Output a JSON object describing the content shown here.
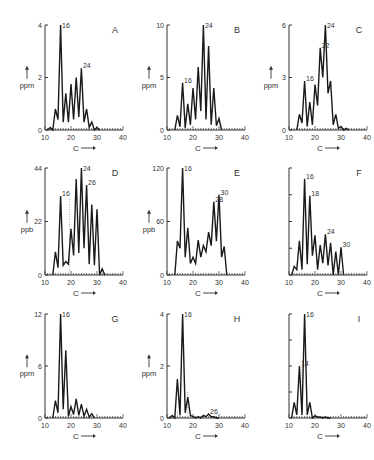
{
  "figure": {
    "x_arrow_label": "C",
    "colors": {
      "line": "#1a1a1a",
      "axis": "#333333",
      "text": "#333333",
      "dotted": "#888888"
    }
  },
  "chart_data": [
    {
      "panel": "A",
      "type": "line",
      "unit": "ppm",
      "xlim": [
        10,
        40
      ],
      "xticks": [
        10,
        20,
        30,
        40
      ],
      "ylim": [
        0,
        4
      ],
      "yticks": [
        0,
        2,
        4
      ],
      "ytick_labels": [
        "0",
        "2",
        "4"
      ],
      "xlabel": "C",
      "ylabel": "ppm",
      "x": [
        11,
        12,
        13,
        14,
        15,
        16,
        17,
        18,
        19,
        20,
        21,
        22,
        23,
        24,
        25,
        26,
        27,
        28,
        29,
        30,
        31
      ],
      "y": [
        0,
        0.1,
        0,
        0.8,
        0.4,
        4.0,
        0.3,
        1.4,
        0.3,
        1.75,
        0.4,
        2.0,
        0.5,
        2.35,
        0.3,
        0.8,
        0.1,
        0.3,
        0,
        0.1,
        0
      ],
      "peak_labels": [
        {
          "x": 16,
          "text": "16"
        },
        {
          "x": 24,
          "text": "24"
        }
      ],
      "dotted_lines": []
    },
    {
      "panel": "B",
      "type": "line",
      "unit": "ppm",
      "xlim": [
        10,
        40
      ],
      "xticks": [
        10,
        20,
        30,
        40
      ],
      "ylim": [
        0,
        10
      ],
      "yticks": [
        0,
        5,
        10
      ],
      "ytick_labels": [
        "0",
        "5",
        "10"
      ],
      "xlabel": "C",
      "ylabel": "ppm",
      "x": [
        13,
        14,
        15,
        16,
        17,
        18,
        19,
        20,
        21,
        22,
        23,
        24,
        25,
        26,
        27,
        28,
        29,
        30,
        31
      ],
      "y": [
        0,
        1.4,
        0.3,
        4.5,
        0.2,
        2.5,
        0.5,
        4.0,
        1.0,
        6.0,
        1.8,
        10.0,
        1.0,
        8.0,
        0.5,
        4.0,
        0.4,
        1.1,
        0
      ],
      "peak_labels": [
        {
          "x": 16,
          "text": "16"
        },
        {
          "x": 24,
          "text": "24"
        }
      ],
      "dotted_lines": []
    },
    {
      "panel": "C",
      "type": "line",
      "unit": "ppm",
      "xlim": [
        10,
        40
      ],
      "xticks": [
        10,
        20,
        30,
        40
      ],
      "ylim": [
        0,
        6
      ],
      "yticks": [
        0,
        3,
        6
      ],
      "ytick_labels": [
        "0",
        "3",
        "6"
      ],
      "xlabel": "C",
      "ylabel": "ppm",
      "x": [
        13,
        14,
        15,
        16,
        17,
        18,
        19,
        20,
        21,
        22,
        23,
        24,
        25,
        26,
        27,
        28,
        29,
        30,
        31,
        32,
        33
      ],
      "y": [
        0,
        0.9,
        0.4,
        2.8,
        0.2,
        1.6,
        0.3,
        2.6,
        1.4,
        4.7,
        3.0,
        6.0,
        2.1,
        2.8,
        0.3,
        0.9,
        0.1,
        0.2,
        0,
        0.1,
        0
      ],
      "peak_labels": [
        {
          "x": 16,
          "text": "16"
        },
        {
          "x": 22,
          "text": "22"
        },
        {
          "x": 24,
          "text": "24"
        }
      ],
      "dotted_lines": []
    },
    {
      "panel": "D",
      "type": "line",
      "unit": "ppb",
      "xlim": [
        10,
        40
      ],
      "xticks": [
        10,
        20,
        30,
        40
      ],
      "ylim": [
        0,
        44
      ],
      "yticks": [
        0,
        22,
        44
      ],
      "ytick_labels": [
        "0",
        "22",
        "44"
      ],
      "xlabel": "C",
      "ylabel": "ppb",
      "x": [
        13,
        14,
        15,
        16,
        17,
        18,
        19,
        20,
        21,
        22,
        23,
        24,
        25,
        26,
        27,
        28,
        29,
        30,
        31,
        32,
        33
      ],
      "y": [
        0,
        9.5,
        3.0,
        32.5,
        4.0,
        5.5,
        4.5,
        19.0,
        8.0,
        39.5,
        9.0,
        44.0,
        11.0,
        37.0,
        4.5,
        29.0,
        4.0,
        27.0,
        0,
        2.5,
        0
      ],
      "peak_labels": [
        {
          "x": 16,
          "text": "16"
        },
        {
          "x": 24,
          "text": "24"
        },
        {
          "x": 26,
          "text": "26"
        }
      ],
      "dotted_lines": [
        {
          "x": 19.5,
          "y_top": 32
        }
      ]
    },
    {
      "panel": "E",
      "type": "line",
      "unit": "ppb",
      "xlim": [
        10,
        40
      ],
      "xticks": [
        10,
        20,
        30,
        40
      ],
      "ylim": [
        0,
        120
      ],
      "yticks": [
        0,
        60,
        120
      ],
      "ytick_labels": [
        "0",
        "60",
        "120"
      ],
      "xlabel": "C",
      "ylabel": "ppb",
      "x": [
        13,
        14,
        15,
        16,
        17,
        18,
        19,
        20,
        21,
        22,
        23,
        24,
        25,
        26,
        27,
        28,
        29,
        30,
        31,
        32,
        33
      ],
      "y": [
        0,
        38,
        30,
        120,
        20,
        53,
        13,
        20,
        13,
        39,
        20,
        33,
        26,
        48,
        33,
        82,
        38,
        90,
        20,
        32,
        0
      ],
      "peak_labels": [
        {
          "x": 16,
          "text": "16"
        },
        {
          "x": 28,
          "text": "28"
        },
        {
          "x": 30,
          "text": "30"
        }
      ],
      "dotted_lines": []
    },
    {
      "panel": "F",
      "type": "line",
      "unit": "",
      "xlim": [
        10,
        40
      ],
      "xticks": [
        10,
        20,
        30,
        40
      ],
      "ylim": [
        0,
        100
      ],
      "yticks": [
        0,
        25,
        50,
        75,
        100
      ],
      "ytick_labels": [
        "",
        "",
        "",
        "",
        ""
      ],
      "xlabel": "C",
      "ylabel": "",
      "x": [
        11,
        12,
        13,
        14,
        15,
        16,
        17,
        18,
        19,
        20,
        21,
        22,
        23,
        24,
        25,
        26,
        27,
        28,
        29,
        30,
        31
      ],
      "y": [
        0,
        8,
        5,
        32,
        5,
        90,
        10,
        74,
        18,
        37,
        5,
        28,
        11,
        38,
        9,
        30,
        0,
        22,
        0,
        26,
        0
      ],
      "peak_labels": [
        {
          "x": 16,
          "text": "16"
        },
        {
          "x": 18,
          "text": "18"
        },
        {
          "x": 24,
          "text": "24"
        },
        {
          "x": 30,
          "text": "30"
        }
      ],
      "dotted_lines": []
    },
    {
      "panel": "G",
      "type": "line",
      "unit": "ppm",
      "xlim": [
        10,
        40
      ],
      "xticks": [
        10,
        20,
        30,
        40
      ],
      "ylim": [
        0,
        12
      ],
      "yticks": [
        0,
        6,
        12
      ],
      "ytick_labels": [
        "0",
        "6",
        "12"
      ],
      "xlabel": "C",
      "ylabel": "ppm",
      "x": [
        13,
        14,
        15,
        16,
        17,
        18,
        19,
        20,
        21,
        22,
        23,
        24,
        25,
        26,
        27,
        28,
        29
      ],
      "y": [
        0,
        2.0,
        0.6,
        12.0,
        1.0,
        7.8,
        0.2,
        1.3,
        0.4,
        2.2,
        0.3,
        1.6,
        0.2,
        1.0,
        0.1,
        0.5,
        0
      ],
      "peak_labels": [
        {
          "x": 16,
          "text": "16"
        }
      ],
      "dotted_lines": []
    },
    {
      "panel": "H",
      "type": "line",
      "unit": "ppm",
      "xlim": [
        10,
        40
      ],
      "xticks": [
        10,
        20,
        30,
        40
      ],
      "ylim": [
        0,
        4
      ],
      "yticks": [
        0,
        2,
        4
      ],
      "ytick_labels": [
        "0",
        "2",
        "4"
      ],
      "xlabel": "C",
      "ylabel": "ppm",
      "x": [
        11,
        12,
        13,
        14,
        15,
        16,
        17,
        18,
        19,
        20,
        21,
        22,
        23,
        24,
        25,
        26,
        27,
        28,
        29,
        30
      ],
      "y": [
        0,
        0.1,
        0,
        1.5,
        0.1,
        4.0,
        0.2,
        0.8,
        0.1,
        0.05,
        0,
        0.05,
        0,
        0.1,
        0.05,
        0.15,
        0.05,
        0.05,
        0,
        0
      ],
      "peak_labels": [
        {
          "x": 16,
          "text": "16"
        },
        {
          "x": 26,
          "text": "26"
        }
      ],
      "dotted_lines": [
        {
          "x": 14,
          "y_top": 0.3
        },
        {
          "x": 18,
          "y_top": 1.0
        }
      ]
    },
    {
      "panel": "I",
      "type": "line",
      "unit": "",
      "xlim": [
        10,
        40
      ],
      "xticks": [
        10,
        20,
        30,
        40
      ],
      "ylim": [
        0,
        100
      ],
      "yticks": [
        0,
        25,
        50,
        75,
        100
      ],
      "ytick_labels": [
        "",
        "",
        "",
        "",
        ""
      ],
      "xlabel": "C",
      "ylabel": "",
      "x": [
        11,
        12,
        13,
        14,
        15,
        16,
        17,
        18,
        19,
        20,
        21,
        22,
        23,
        24,
        25,
        26
      ],
      "y": [
        0,
        15,
        3,
        50,
        3,
        100,
        3,
        15,
        0,
        2,
        1,
        1,
        0,
        1,
        0,
        0
      ],
      "peak_labels": [
        {
          "x": 14,
          "text": "14"
        },
        {
          "x": 16,
          "text": "16"
        }
      ],
      "dotted_lines": [
        {
          "x": 15,
          "y_top": 50
        }
      ]
    }
  ]
}
